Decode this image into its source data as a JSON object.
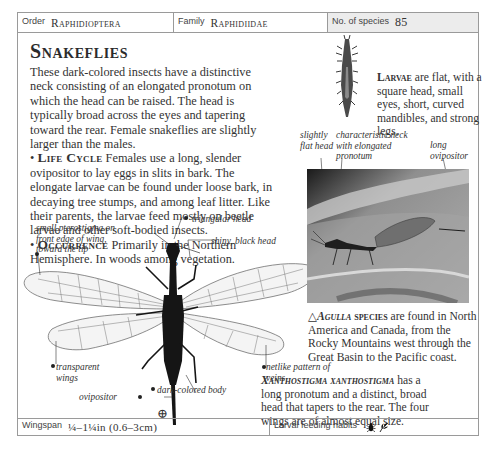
{
  "header": {
    "order_label": "Order",
    "order_value": "Raphidioptera",
    "family_label": "Family",
    "family_value": "Raphidiidae",
    "species_label": "No. of species",
    "species_value": "85"
  },
  "title": "Snakeflies",
  "intro": "These dark-colored insects have a distinctive neck consisting of an elongated pronotum on which the head can be raised. The head is typically broad across the eyes and tapering toward the rear. Female snakeflies are slightly larger than the males.",
  "life_cycle": {
    "heading": "Life Cycle",
    "text": "Females use a long, slender ovipositor to lay eggs in slits in bark. The elongate larvae can be found under loose bark, in decaying tree stumps, and among leaf litter. Like their parents, the larvae feed mostly on beetle larvae and other soft-bodied insects."
  },
  "occurrence": {
    "heading": "Occurrence",
    "text": "Primarily in the Northern Hemisphere. In woods among vegetation."
  },
  "larvae": {
    "heading": "Larvae",
    "text": "are flat, with a square head, small eyes, short, curved mandibles, and strong legs."
  },
  "photo_annotations": {
    "flat_head": "slightly flat head",
    "neck": "characteristic neck with elongated pronotum",
    "ovipositor": "long ovipositor"
  },
  "agulla_caption": {
    "symbol": "△",
    "heading": "Agulla",
    "heading_suffix": "species",
    "text": "are found in North America and Canada, from the Rocky Mountains west through the Great Basin to the Pacific coast."
  },
  "specimen_annotations": {
    "pterostigma": "small pterostigma on front edge of wing, toward the tip",
    "triangular_head": "triangular head",
    "shiny_head": "shiny, black head",
    "transparent_wings": "transparent wings",
    "netlike_veins": "netlike pattern of veins",
    "ovipositor": "ovipositor",
    "dark_body": "dark-colored body"
  },
  "xanthostigma_caption": {
    "heading": "Xanthostigma xanthostigma",
    "text": "has a long pronotum and a distinct, broad head that tapers to the rear. The four wings are of almost equal size."
  },
  "footer": {
    "wingspan_label": "Wingspan",
    "wingspan_value": "¼–1¼in (0.6–3cm)",
    "feeding_label": "Larval feeding habits",
    "feeding_icons": [
      "beetle-icon",
      "plant-icon"
    ]
  },
  "zoom_symbol": "⊕"
}
